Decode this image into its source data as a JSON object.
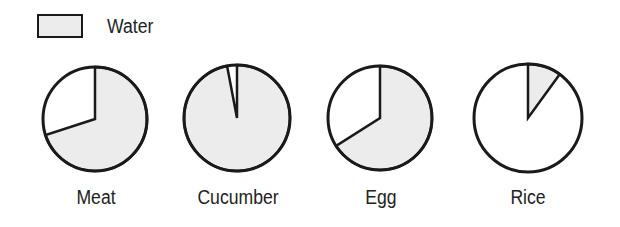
{
  "chart_data": {
    "type": "pie",
    "title": "",
    "legend": [
      {
        "label": "Water",
        "color": "#ececec"
      }
    ],
    "legend_position": "top-left",
    "categories": [
      "Meat",
      "Cucumber",
      "Egg",
      "Rice"
    ],
    "series": [
      {
        "name": "Water",
        "values": [
          70,
          97,
          66,
          10
        ],
        "unit": "%"
      }
    ],
    "pies": [
      {
        "label": "Meat",
        "water_pct": 70,
        "other_pct": 30
      },
      {
        "label": "Cucumber",
        "water_pct": 97,
        "other_pct": 3
      },
      {
        "label": "Egg",
        "water_pct": 66,
        "other_pct": 34
      },
      {
        "label": "Rice",
        "water_pct": 10,
        "other_pct": 90
      }
    ]
  },
  "legend": {
    "water_label": "Water"
  },
  "colors": {
    "water": "#ececec",
    "other": "#ffffff",
    "stroke": "#1a1a1a"
  }
}
